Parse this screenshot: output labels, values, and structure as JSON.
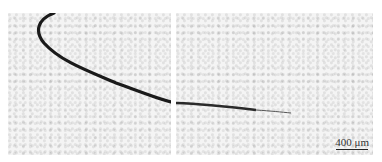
{
  "figure": {
    "panels": [
      {
        "id": "left",
        "description": "micrograph with curved dark crack"
      },
      {
        "id": "right",
        "description": "micrograph with crack tip fading to the right"
      }
    ],
    "scale_bar": {
      "label": "400 μm"
    }
  }
}
